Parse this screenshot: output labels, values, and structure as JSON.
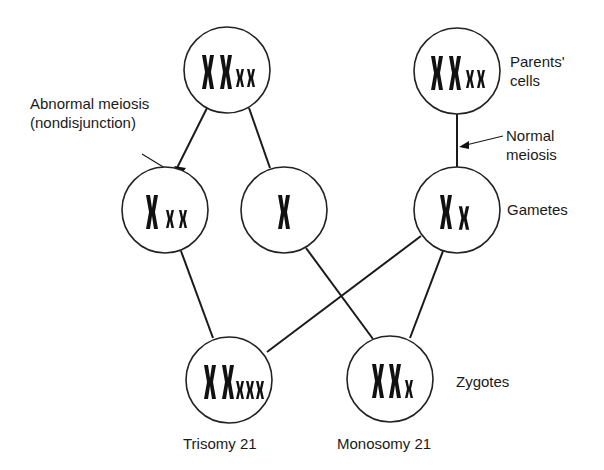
{
  "labels": {
    "abnormal_meiosis": [
      "Abnormal meiosis",
      "(nondisjunction)"
    ],
    "parents_cells": [
      "Parents'",
      "cells"
    ],
    "normal_meiosis": [
      "Normal",
      "meiosis"
    ],
    "gametes": "Gametes",
    "zygotes": "Zygotes",
    "trisomy": "Trisomy 21",
    "monosomy": "Monosomy 21"
  },
  "nodes": [
    {
      "id": "parent-abnormal",
      "level": "parent",
      "large_chromosomes": 2,
      "small_chromosomes": 2
    },
    {
      "id": "parent-normal",
      "level": "parent",
      "large_chromosomes": 2,
      "small_chromosomes": 2
    },
    {
      "id": "gamete-disomic",
      "level": "gamete",
      "large_chromosomes": 1,
      "small_chromosomes": 2
    },
    {
      "id": "gamete-nullisomic",
      "level": "gamete",
      "large_chromosomes": 1,
      "small_chromosomes": 0
    },
    {
      "id": "gamete-normal",
      "level": "gamete",
      "large_chromosomes": 1,
      "small_chromosomes": 1
    },
    {
      "id": "zygote-trisomy",
      "level": "zygote",
      "large_chromosomes": 2,
      "small_chromosomes": 3
    },
    {
      "id": "zygote-monosomy",
      "level": "zygote",
      "large_chromosomes": 2,
      "small_chromosomes": 1
    }
  ],
  "edges": [
    [
      "parent-abnormal",
      "gamete-disomic"
    ],
    [
      "parent-abnormal",
      "gamete-nullisomic"
    ],
    [
      "parent-normal",
      "gamete-normal"
    ],
    [
      "gamete-disomic",
      "zygote-trisomy"
    ],
    [
      "gamete-normal",
      "zygote-trisomy"
    ],
    [
      "gamete-nullisomic",
      "zygote-monosomy"
    ],
    [
      "gamete-normal",
      "zygote-monosomy"
    ]
  ]
}
